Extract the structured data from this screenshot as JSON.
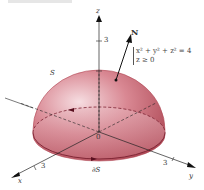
{
  "figure": {
    "surface_label": "S",
    "normal_label": "N",
    "boundary_label": "∂S",
    "equation_lines": [
      "x² + y² + z² = 4",
      "z ≥ 0"
    ],
    "axes": {
      "x_label": "x",
      "y_label": "y",
      "z_label": "z",
      "origin_label": "0",
      "x_tick": "3",
      "y_tick": "3",
      "z_tick": "3"
    },
    "colors": {
      "surface": "#c96a78",
      "surface_highlight": "#f3d4d8",
      "axis": "#222222"
    }
  }
}
